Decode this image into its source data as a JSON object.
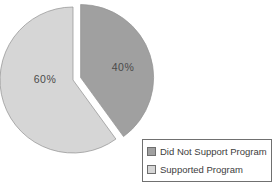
{
  "chart_data": {
    "type": "pie",
    "title": "",
    "start_angle_deg": 0,
    "direction": "clockwise",
    "legend_position": "bottom-right",
    "categories": [
      "Did Not Support Program",
      "Supported Program"
    ],
    "values": [
      40,
      60
    ],
    "slices": [
      {
        "label": "Did Not Support Program",
        "value": 40,
        "data_label": "40%",
        "color": "#a0a0a0",
        "exploded": true
      },
      {
        "label": "Supported Program",
        "value": 60,
        "data_label": "60%",
        "color": "#d6d6d6",
        "exploded": false
      }
    ]
  },
  "colors": {
    "slice_outline": "#969696",
    "data_label_text": "#4a4a4a",
    "legend_border": "#707070",
    "legend_text": "#3d3d3d",
    "background": "#ffffff"
  }
}
